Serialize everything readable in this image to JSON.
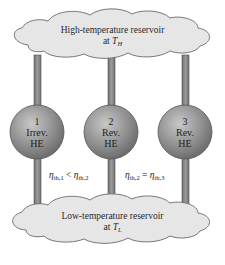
{
  "high_reservoir": {
    "line1": "High-temperature reservoir",
    "line2_prefix": "at ",
    "temp_symbol": "T",
    "temp_subscript": "H"
  },
  "low_reservoir": {
    "line1": "Low-temperature reservoir",
    "line2_prefix": "at ",
    "temp_symbol": "T",
    "temp_subscript": "L"
  },
  "engines": [
    {
      "number": "1",
      "type": "Irrev.",
      "abbr": "HE"
    },
    {
      "number": "2",
      "type": "Rev.",
      "abbr": "HE"
    },
    {
      "number": "3",
      "type": "Rev.",
      "abbr": "HE"
    }
  ],
  "relations": [
    {
      "left_sym": "η",
      "left_sub": "th,1",
      "op": "<",
      "right_sym": "η",
      "right_sub": "th,2"
    },
    {
      "left_sym": "η",
      "left_sub": "th,2",
      "op": "=",
      "right_sym": "η",
      "right_sub": "th,3"
    }
  ],
  "colors": {
    "cloud_fill": "#e4e4e4",
    "cloud_stroke": "#6a6a6a",
    "pipe_fill": "#8a8a8a",
    "sphere_base": "#8c8c8c",
    "sphere_highlight": "#c4c4c4"
  }
}
